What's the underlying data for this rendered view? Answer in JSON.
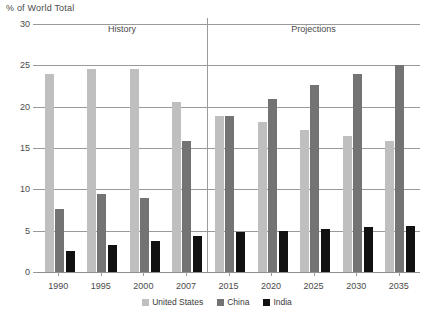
{
  "chart_data": {
    "type": "bar",
    "title": "",
    "ylabel": "% of World Total",
    "xlabel": "",
    "ylim": [
      0,
      30
    ],
    "yticks": [
      0,
      5,
      10,
      15,
      20,
      25,
      30
    ],
    "grid": true,
    "legend_position": "bottom",
    "categories": [
      "1990",
      "1995",
      "2000",
      "2007",
      "2015",
      "2020",
      "2025",
      "2030",
      "2035"
    ],
    "series": [
      {
        "name": "United States",
        "color": "#bfbfbf",
        "values": [
          24.0,
          24.5,
          24.5,
          20.6,
          18.9,
          18.1,
          17.2,
          16.5,
          15.9
        ]
      },
      {
        "name": "China",
        "color": "#737373",
        "values": [
          7.6,
          9.4,
          9.0,
          15.8,
          18.9,
          20.9,
          22.6,
          24.0,
          25.0
        ]
      },
      {
        "name": "India",
        "color": "#111111",
        "values": [
          2.6,
          3.3,
          3.8,
          4.3,
          4.8,
          5.0,
          5.2,
          5.4,
          5.6
        ]
      }
    ],
    "annotations": [
      {
        "text": "History",
        "category_span": [
          "1990",
          "2007"
        ]
      },
      {
        "text": "Projections",
        "category_span": [
          "2015",
          "2035"
        ]
      }
    ],
    "divider_after_category": "2007"
  },
  "legend": {
    "items": [
      {
        "label": "United States",
        "color": "#bfbfbf"
      },
      {
        "label": "China",
        "color": "#737373"
      },
      {
        "label": "India",
        "color": "#111111"
      }
    ]
  }
}
